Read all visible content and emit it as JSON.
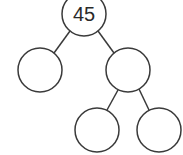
{
  "diagram": {
    "type": "factor-tree",
    "nodes": [
      {
        "id": "root",
        "label": "45",
        "cx": 84,
        "cy": 14,
        "r": 22
      },
      {
        "id": "left",
        "label": "",
        "cx": 40,
        "cy": 70,
        "r": 22
      },
      {
        "id": "right",
        "label": "",
        "cx": 128,
        "cy": 70,
        "r": 22
      },
      {
        "id": "right-left",
        "label": "",
        "cx": 97,
        "cy": 130,
        "r": 22
      },
      {
        "id": "right-right",
        "label": "",
        "cx": 159,
        "cy": 130,
        "r": 22
      }
    ],
    "edges": [
      {
        "from": "root",
        "to": "left"
      },
      {
        "from": "root",
        "to": "right"
      },
      {
        "from": "right",
        "to": "right-left"
      },
      {
        "from": "right",
        "to": "right-right"
      }
    ],
    "colors": {
      "stroke": "#3a3a3a",
      "fill": "#ffffff",
      "text": "#2a2a2a"
    }
  }
}
